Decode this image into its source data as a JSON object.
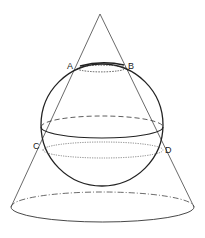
{
  "diagram": {
    "labels": {
      "A": "A",
      "B": "B",
      "C": "C",
      "D": "D"
    },
    "colors": {
      "stroke": "#333333",
      "background": "#ffffff"
    }
  }
}
